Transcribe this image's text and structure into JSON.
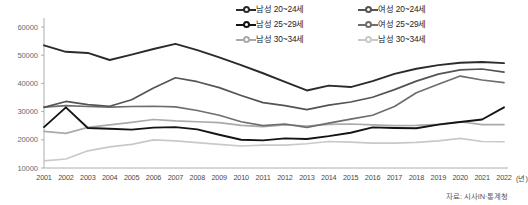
{
  "chart_data": {
    "type": "line",
    "title": "",
    "xlabel": "(년)",
    "ylabel": "",
    "x": [
      2001,
      2002,
      2003,
      2004,
      2005,
      2006,
      2007,
      2008,
      2009,
      2010,
      2011,
      2012,
      2013,
      2014,
      2015,
      2016,
      2017,
      2018,
      2019,
      2020,
      2021,
      2022
    ],
    "ylim": [
      10000,
      60000
    ],
    "yticks": [
      10000,
      20000,
      30000,
      40000,
      50000,
      60000
    ],
    "grid": false,
    "legend_position": "top-right",
    "series": [
      {
        "name": "남성 20~24세",
        "color": "#2b2b2b",
        "values": [
          53500,
          51200,
          50800,
          48300,
          50200,
          52200,
          54000,
          51800,
          49200,
          46500,
          43600,
          40500,
          37500,
          39200,
          38700,
          40800,
          43400,
          45200,
          46500,
          47300,
          47600,
          47200
        ]
      },
      {
        "name": "여성 20~24세",
        "color": "#545454",
        "values": [
          31500,
          33600,
          32500,
          31900,
          34200,
          38400,
          42000,
          40600,
          38500,
          35700,
          33200,
          32100,
          30700,
          32300,
          33400,
          35100,
          37800,
          40800,
          43300,
          44800,
          45100,
          44000
        ]
      },
      {
        "name": "남성 25~29세",
        "color": "#141414",
        "values": [
          24500,
          31500,
          24200,
          23900,
          23600,
          24300,
          24500,
          23700,
          21800,
          20000,
          19800,
          20500,
          20300,
          21300,
          22500,
          24400,
          24200,
          24100,
          25400,
          26300,
          27200,
          31500
        ]
      },
      {
        "name": "여성 25~29세",
        "color": "#6e6e6e",
        "values": [
          31600,
          32100,
          31800,
          31600,
          31800,
          31900,
          31700,
          30400,
          28700,
          26400,
          25000,
          25600,
          24400,
          25900,
          27300,
          28700,
          31800,
          36700,
          39700,
          42600,
          41200,
          40300
        ]
      },
      {
        "name": "남성 30~34세",
        "color": "#aaaaaa",
        "values": [
          23000,
          22300,
          24400,
          25300,
          26200,
          27200,
          26700,
          26400,
          26100,
          25100,
          24700,
          25300,
          24900,
          25500,
          25600,
          25300,
          25000,
          25100,
          25500,
          26400,
          25400,
          25400
        ]
      },
      {
        "name": "남성 30~34세",
        "color": "#c9c9c9",
        "values": [
          12500,
          13200,
          16100,
          17500,
          18400,
          20000,
          19600,
          19000,
          18400,
          17800,
          18100,
          18100,
          18600,
          19400,
          19200,
          18800,
          18800,
          19100,
          19600,
          20500,
          19400,
          19300
        ]
      }
    ]
  },
  "legend": {
    "items": [
      {
        "label": "남성 20~24세"
      },
      {
        "label": "여성 20~24세"
      },
      {
        "label": "남성 25~29세"
      },
      {
        "label": "여성 25~29세"
      },
      {
        "label": "남성 30~34세"
      },
      {
        "label": "남성 30~34세"
      }
    ]
  },
  "axis": {
    "y_ticks": [
      "60000",
      "50000",
      "40000",
      "30000",
      "20000",
      "10000"
    ],
    "x_ticks": [
      "2001",
      "2002",
      "2003",
      "2004",
      "2005",
      "2006",
      "2007",
      "2008",
      "2009",
      "2010",
      "2011",
      "2012",
      "2013",
      "2014",
      "2015",
      "2016",
      "2017",
      "2018",
      "2019",
      "2020",
      "2021",
      "2022"
    ],
    "x_unit": "(년)"
  },
  "footer": {
    "source": "자료: 시사IN·통계청"
  }
}
